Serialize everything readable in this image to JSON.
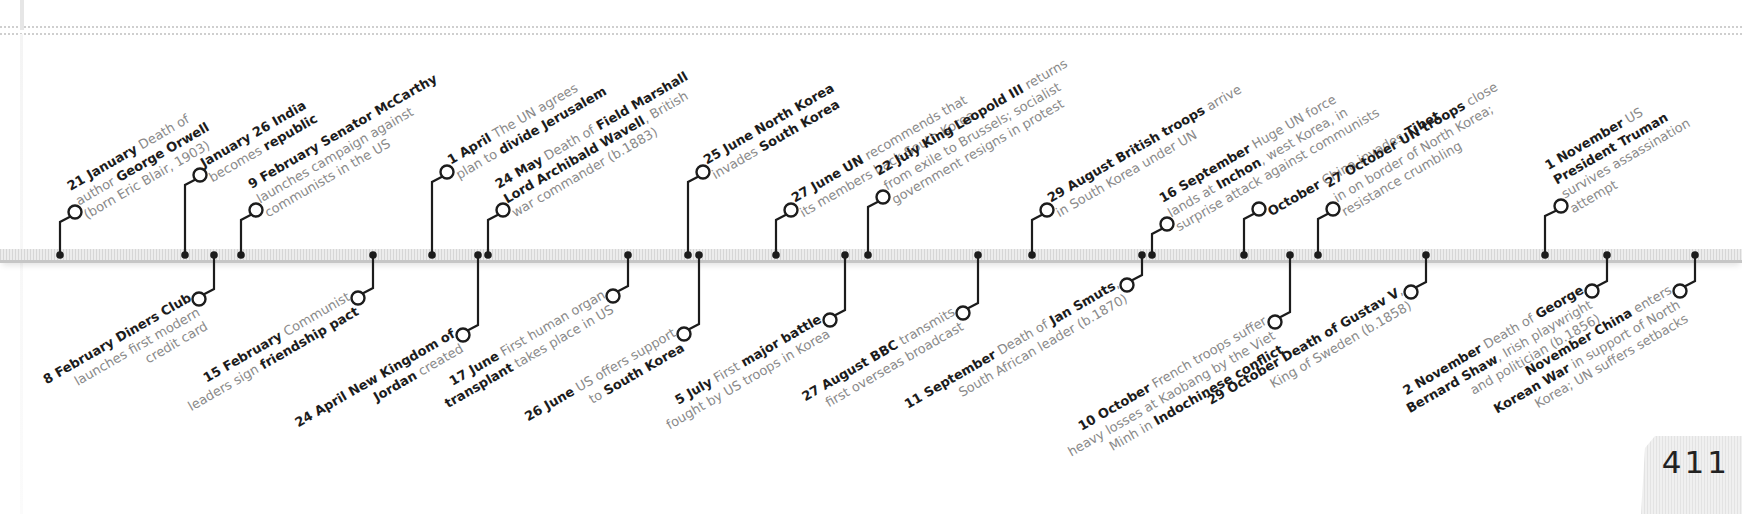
{
  "page": {
    "number": "411"
  },
  "colors": {
    "ink": "#1c1c1c",
    "body_text": "#8a8a8a",
    "bar": "#d9d9d9"
  },
  "timeline": {
    "above": [
      {
        "id": "21-jan",
        "dot_x": 60,
        "circle": [
          75,
          212
        ],
        "lines": [
          [
            {
              "b": "21 January"
            },
            {
              "t": " Death of"
            }
          ],
          [
            {
              "t": "author "
            },
            {
              "b": "George Orwell"
            }
          ],
          [
            {
              "t": "(born Eric Blair, 1903)"
            }
          ]
        ]
      },
      {
        "id": "jan-26",
        "dot_x": 185,
        "circle": [
          200,
          175
        ],
        "lines": [
          [
            {
              "b": "January 26 India"
            }
          ],
          [
            {
              "t": "becomes "
            },
            {
              "b": "republic"
            }
          ]
        ]
      },
      {
        "id": "9-feb",
        "dot_x": 241,
        "circle": [
          256,
          210
        ],
        "lines": [
          [
            {
              "b": "9 February Senator McCarthy"
            }
          ],
          [
            {
              "t": "launches campaign against"
            }
          ],
          [
            {
              "t": "communists in the US"
            }
          ]
        ]
      },
      {
        "id": "1-apr",
        "dot_x": 432,
        "circle": [
          447,
          172
        ],
        "lines": [
          [
            {
              "b": "1 April"
            },
            {
              "t": " The UN agrees"
            }
          ],
          [
            {
              "t": "plan to "
            },
            {
              "b": "divide Jerusalem"
            }
          ]
        ]
      },
      {
        "id": "24-may",
        "dot_x": 488,
        "circle": [
          503,
          210
        ],
        "lines": [
          [
            {
              "b": "24 May"
            },
            {
              "t": " Death of "
            },
            {
              "b": "Field Marshall"
            }
          ],
          [
            {
              "b": "Lord Archibald Wavell"
            },
            {
              "t": ", British"
            }
          ],
          [
            {
              "t": "war commander (b.1883)"
            }
          ]
        ]
      },
      {
        "id": "25-jun",
        "dot_x": 688,
        "circle": [
          703,
          172
        ],
        "lines": [
          [
            {
              "b": "25 June North Korea"
            }
          ],
          [
            {
              "t": "invades "
            },
            {
              "b": "South Korea"
            }
          ]
        ]
      },
      {
        "id": "27-jun",
        "dot_x": 776,
        "circle": [
          791,
          210
        ],
        "lines": [
          [
            {
              "b": "27 June UN"
            },
            {
              "t": " recommends that"
            }
          ],
          [
            {
              "t": "its members back South Korea"
            }
          ]
        ]
      },
      {
        "id": "22-jul",
        "dot_x": 868,
        "circle": [
          883,
          197
        ],
        "lines": [
          [
            {
              "b": "22 July King Leopold III"
            },
            {
              "t": " returns"
            }
          ],
          [
            {
              "t": "from exile to Brussels; socialist"
            }
          ],
          [
            {
              "t": "government resigns in protest"
            }
          ]
        ]
      },
      {
        "id": "29-aug",
        "dot_x": 1032,
        "circle": [
          1047,
          210
        ],
        "lines": [
          [
            {
              "b": "29 August British troops"
            },
            {
              "t": " arrive"
            }
          ],
          [
            {
              "t": "in South Korea under UN"
            }
          ]
        ]
      },
      {
        "id": "16-sep",
        "dot_x": 1152,
        "circle": [
          1167,
          224
        ],
        "lines": [
          [
            {
              "b": "16 September"
            },
            {
              "t": " Huge UN force"
            }
          ],
          [
            {
              "t": "lands at "
            },
            {
              "b": "Inchon"
            },
            {
              "t": ", west Korea, in"
            }
          ],
          [
            {
              "t": "surprise attack against communists"
            }
          ]
        ]
      },
      {
        "id": "oct",
        "dot_x": 1244,
        "circle": [
          1259,
          209
        ],
        "lines": [
          [
            {
              "b": "October"
            },
            {
              "t": " China invades "
            },
            {
              "b": "Tibet"
            }
          ]
        ]
      },
      {
        "id": "27-oct",
        "dot_x": 1318,
        "circle": [
          1333,
          209
        ],
        "lines": [
          [
            {
              "b": "27 October UN troops"
            },
            {
              "t": " close"
            }
          ],
          [
            {
              "t": "in on border of North Korea;"
            }
          ],
          [
            {
              "t": "resistance crumbling"
            }
          ]
        ]
      },
      {
        "id": "1-nov",
        "dot_x": 1545,
        "circle": [
          1561,
          206
        ],
        "lines": [
          [
            {
              "b": "1 November"
            },
            {
              "t": " US"
            }
          ],
          [
            {
              "b": "President Truman"
            }
          ],
          [
            {
              "t": "survives assassination"
            }
          ],
          [
            {
              "t": "attempt"
            }
          ]
        ]
      }
    ],
    "below": [
      {
        "id": "8-feb",
        "dot_x": 214,
        "circle": [
          199,
          299
        ],
        "lines": [
          [
            {
              "b": "8 February Diners Club"
            }
          ],
          [
            {
              "t": "launches first modern"
            }
          ],
          [
            {
              "t": "credit card"
            }
          ]
        ]
      },
      {
        "id": "15-feb",
        "dot_x": 373,
        "circle": [
          358,
          298
        ],
        "lines": [
          [
            {
              "b": "15 February"
            },
            {
              "t": " Communist"
            }
          ],
          [
            {
              "t": "leaders sign "
            },
            {
              "b": "friendship pact"
            }
          ]
        ]
      },
      {
        "id": "24-apr",
        "dot_x": 478,
        "circle": [
          463,
          335
        ],
        "lines": [
          [
            {
              "b": "24 April New Kingdom of"
            }
          ],
          [
            {
              "b": "Jordan"
            },
            {
              "t": " created"
            }
          ]
        ]
      },
      {
        "id": "17-jun",
        "dot_x": 628,
        "circle": [
          613,
          296
        ],
        "lines": [
          [
            {
              "b": "17 June"
            },
            {
              "t": " First human organ"
            }
          ],
          [
            {
              "b": "transplant"
            },
            {
              "t": " takes place in US"
            }
          ]
        ]
      },
      {
        "id": "26-jun",
        "dot_x": 699,
        "circle": [
          684,
          334
        ],
        "lines": [
          [
            {
              "b": "26 June"
            },
            {
              "t": " US offers support"
            }
          ],
          [
            {
              "t": "to "
            },
            {
              "b": "South Korea"
            }
          ]
        ]
      },
      {
        "id": "5-jul",
        "dot_x": 845,
        "circle": [
          830,
          320
        ],
        "lines": [
          [
            {
              "b": "5 July"
            },
            {
              "t": " First "
            },
            {
              "b": "major battle"
            }
          ],
          [
            {
              "t": "fought by US troops in Korea"
            }
          ]
        ]
      },
      {
        "id": "27-aug",
        "dot_x": 978,
        "circle": [
          963,
          313
        ],
        "lines": [
          [
            {
              "b": "27 August BBC"
            },
            {
              "t": " transmits"
            }
          ],
          [
            {
              "t": "first overseas broadcast"
            }
          ]
        ]
      },
      {
        "id": "11-sep",
        "dot_x": 1142,
        "circle": [
          1127,
          285
        ],
        "lines": [
          [
            {
              "b": "11 September"
            },
            {
              "t": " Death of "
            },
            {
              "b": "Jan Smuts"
            },
            {
              "t": ","
            }
          ],
          [
            {
              "t": "South African leader (b.1870)"
            }
          ]
        ]
      },
      {
        "id": "10-oct",
        "dot_x": 1290,
        "circle": [
          1275,
          322
        ],
        "lines": [
          [
            {
              "b": "10 October"
            },
            {
              "t": " French troops suffer"
            }
          ],
          [
            {
              "t": "heavy losses at Kaobang by the Viet"
            }
          ],
          [
            {
              "t": "Minh in "
            },
            {
              "b": "Indochinese conflict"
            }
          ]
        ]
      },
      {
        "id": "29-oct",
        "dot_x": 1426,
        "circle": [
          1411,
          292
        ],
        "lines": [
          [
            {
              "b": "29 October Death of Gustav V"
            },
            {
              "t": ","
            }
          ],
          [
            {
              "t": "King of Sweden (b.1858)"
            }
          ]
        ]
      },
      {
        "id": "2-nov",
        "dot_x": 1607,
        "circle": [
          1592,
          291
        ],
        "lines": [
          [
            {
              "b": "2 November"
            },
            {
              "t": " Death of "
            },
            {
              "b": "George"
            }
          ],
          [
            {
              "b": "Bernard Shaw"
            },
            {
              "t": ", Irish playwright"
            }
          ],
          [
            {
              "t": "and politician (b.1856)"
            }
          ]
        ]
      },
      {
        "id": "nov",
        "dot_x": 1695,
        "circle": [
          1680,
          291
        ],
        "lines": [
          [
            {
              "b": "November China"
            },
            {
              "t": " enters"
            }
          ],
          [
            {
              "b": "Korean War"
            },
            {
              "t": " in support of North"
            }
          ],
          [
            {
              "t": "Korea; UN suffers setbacks"
            }
          ]
        ]
      }
    ]
  }
}
